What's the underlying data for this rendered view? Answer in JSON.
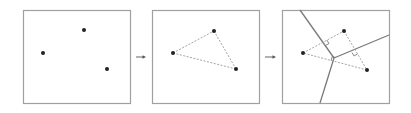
{
  "diagram": {
    "colors": {
      "box_border": "#a0a0a0",
      "point": "#222222",
      "triangle_dashed": "#9a9a9a",
      "voronoi_edge": "#7a7a7a",
      "arrow": "#555555"
    },
    "panels": [
      {
        "id": "points",
        "box": {
          "x": 23,
          "y": 10,
          "w": 107,
          "h": 93
        },
        "points": [
          [
            43,
            53
          ],
          [
            84,
            30
          ],
          [
            107,
            69
          ]
        ]
      },
      {
        "id": "triangulation",
        "box": {
          "x": 152,
          "y": 10,
          "w": 107,
          "h": 93
        },
        "points": [
          [
            173,
            53
          ],
          [
            214,
            31
          ],
          [
            236,
            69
          ]
        ],
        "triangle": true
      },
      {
        "id": "voronoi",
        "box": {
          "x": 282,
          "y": 10,
          "w": 107,
          "h": 93
        },
        "points": [
          [
            303,
            53
          ],
          [
            344,
            31
          ],
          [
            367,
            70
          ]
        ],
        "triangle": true,
        "circumcenter": [
          334,
          58
        ],
        "voronoi_edges": [
          [
            [
              334,
              58
            ],
            [
              300,
              10
            ]
          ],
          [
            [
              334,
              58
            ],
            [
              389,
              35
            ]
          ],
          [
            [
              334,
              58
            ],
            [
              320,
              103
            ]
          ]
        ]
      }
    ],
    "arrows": [
      {
        "x1": 136,
        "y1": 57,
        "x2": 146,
        "y2": 57
      },
      {
        "x1": 265,
        "y1": 57,
        "x2": 276,
        "y2": 57
      }
    ]
  }
}
